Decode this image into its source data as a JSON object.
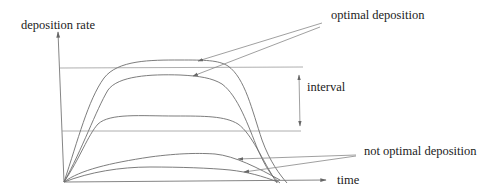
{
  "diagram": {
    "y_axis_label": "deposition rate",
    "x_axis_label": "time",
    "interval_label": "interval",
    "optimal_label": "optimal deposition",
    "not_optimal_label": "not optimal deposition",
    "colors": {
      "background": "#ffffff",
      "line": "#777777",
      "text": "#222222"
    },
    "curves": [
      {
        "name": "optimal-curve-upper",
        "category": "optimal deposition",
        "plateau_y": 62
      },
      {
        "name": "optimal-curve-lower",
        "category": "optimal deposition",
        "plateau_y": 78
      },
      {
        "name": "middle-curve",
        "category": "within interval",
        "plateau_y": 116
      },
      {
        "name": "not-optimal-curve-upper",
        "category": "not optimal deposition",
        "plateau_y": 154
      },
      {
        "name": "not-optimal-curve-lower",
        "category": "not optimal deposition",
        "plateau_y": 167
      }
    ],
    "threshold_lines": [
      {
        "name": "upper-threshold",
        "y": 68
      },
      {
        "name": "lower-threshold",
        "y": 131
      }
    ]
  }
}
